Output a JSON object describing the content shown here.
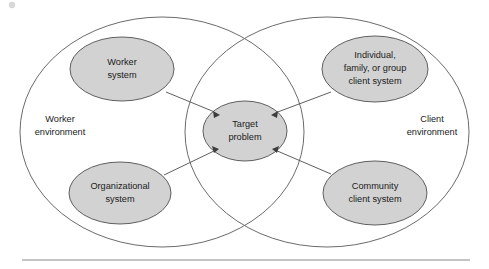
{
  "diagram": {
    "type": "venn-overlap-systems",
    "colors": {
      "node_fill": "#d2d2d2",
      "node_stroke": "#5f5f5f",
      "circle_stroke": "#6b6b6b",
      "text": "#1b1b1b",
      "rule": "#8a8a8a",
      "background": "#ffffff"
    },
    "environments": [
      {
        "id": "worker-environment",
        "label_lines": [
          "Worker",
          "environment"
        ],
        "line1": "Worker",
        "line2": "environment",
        "side": "left",
        "cx": 162,
        "cy": 132,
        "rx": 142,
        "ry": 115,
        "label_x": 60,
        "label_y": 120
      },
      {
        "id": "client-environment",
        "label_lines": [
          "Client",
          "environment"
        ],
        "line1": "Client",
        "line2": "environment",
        "side": "right",
        "cx": 327,
        "cy": 132,
        "rx": 142,
        "ry": 115,
        "label_x": 432,
        "label_y": 120
      }
    ],
    "nodes": [
      {
        "id": "worker-system",
        "label_lines": [
          "Worker",
          "system"
        ],
        "line1": "Worker",
        "line2": "system",
        "cx": 122,
        "cy": 69,
        "rx": 52,
        "ry": 32,
        "belongs_to": "worker-environment"
      },
      {
        "id": "organizational-system",
        "label_lines": [
          "Organizational",
          "system"
        ],
        "line1": "Organizational",
        "line2": "system",
        "cx": 120,
        "cy": 193,
        "rx": 51,
        "ry": 31,
        "belongs_to": "worker-environment"
      },
      {
        "id": "individual-family-group-client-system",
        "label_lines": [
          "Individual,",
          "family, or group",
          "client system"
        ],
        "line1": "Individual,",
        "line2": "family, or group",
        "line3": "client system",
        "cx": 375,
        "cy": 69,
        "rx": 53,
        "ry": 33,
        "belongs_to": "client-environment"
      },
      {
        "id": "community-client-system",
        "label_lines": [
          "Community",
          "client system"
        ],
        "line1": "Community",
        "line2": "client system",
        "cx": 375,
        "cy": 193,
        "rx": 52,
        "ry": 32,
        "belongs_to": "client-environment"
      },
      {
        "id": "target-problem",
        "label_lines": [
          "Target",
          "problem"
        ],
        "line1": "Target",
        "line2": "problem",
        "cx": 245,
        "cy": 131,
        "rx": 42,
        "ry": 30,
        "belongs_to": "overlap"
      }
    ],
    "connectors": [
      {
        "from": "worker-system",
        "to": "target-problem",
        "arrow_at": "target-problem",
        "direction": "down-right"
      },
      {
        "from": "organizational-system",
        "to": "target-problem",
        "arrow_at": "target-problem",
        "direction": "up-right"
      },
      {
        "from": "individual-family-group-client-system",
        "to": "target-problem",
        "arrow_at": "target-problem",
        "direction": "down-left"
      },
      {
        "from": "community-client-system",
        "to": "target-problem",
        "arrow_at": "target-problem",
        "direction": "up-left"
      }
    ],
    "footer_rule": {
      "x1": 22,
      "x2": 470,
      "y": 260
    }
  }
}
